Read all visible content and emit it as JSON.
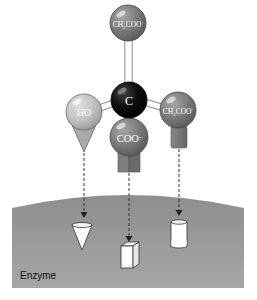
{
  "diagram": {
    "type": "enzyme-substrate three-point attachment",
    "molecule": {
      "center": {
        "label": "C",
        "color": "#0a0a0a"
      },
      "groups": [
        {
          "id": "top",
          "label": "CH2COO-",
          "label_main": "CH",
          "label_sub": "2",
          "label_rest": "COO",
          "label_sup": "-",
          "color": "#7a7a7a"
        },
        {
          "id": "left",
          "label": "HO",
          "color": "#bdbdbd",
          "binding_shape": "cone"
        },
        {
          "id": "bottom",
          "label": "COO-",
          "label_main": "COO",
          "label_sup": "-",
          "color": "#8a8a8a",
          "binding_shape": "square-prism"
        },
        {
          "id": "right",
          "label": "CH2COO-",
          "label_main": "CH",
          "label_sub": "2",
          "label_rest": "COO",
          "label_sup": "-",
          "color": "#7f7f7f",
          "binding_shape": "cylinder"
        }
      ]
    },
    "enzyme": {
      "label": "Enzyme",
      "color": "#9a9a9a",
      "sites": [
        "cone-pocket",
        "square-pocket",
        "cylinder-pocket"
      ]
    }
  }
}
